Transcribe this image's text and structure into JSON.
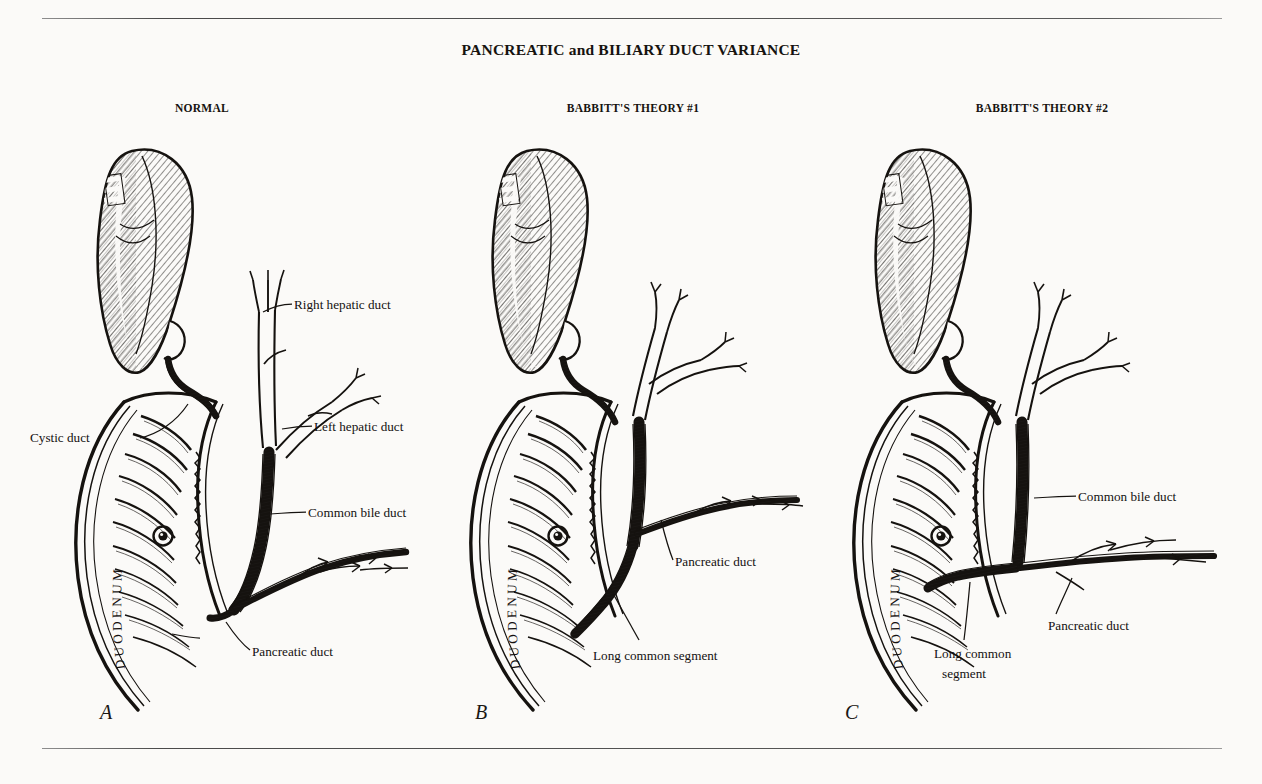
{
  "figure": {
    "title": "PANCREATIC and BILIARY DUCT VARIANCE",
    "background_color": "#fbfaf8",
    "ink_color": "#141110",
    "rule_color": "#4a4a4a"
  },
  "panels": [
    {
      "id": "A",
      "letter": "A",
      "title": "NORMAL",
      "labels": [
        {
          "name": "right-hepatic-duct",
          "text": "Right hepatic duct"
        },
        {
          "name": "left-hepatic-duct",
          "text": "Left hepatic duct"
        },
        {
          "name": "cystic-duct",
          "text": "Cystic duct"
        },
        {
          "name": "common-bile-duct",
          "text": "Common bile duct"
        },
        {
          "name": "pancreatic-duct",
          "text": "Pancreatic duct"
        }
      ],
      "organ_label": "DUODENUM",
      "structures": [
        "gallbladder",
        "cystic duct",
        "right hepatic duct",
        "left hepatic duct",
        "common bile duct",
        "pancreatic duct",
        "duodenum",
        "duodenal papilla"
      ]
    },
    {
      "id": "B",
      "letter": "B",
      "title": "BABBITT'S THEORY #1",
      "labels": [
        {
          "name": "pancreatic-duct",
          "text": "Pancreatic duct"
        },
        {
          "name": "long-common-segment",
          "text": "Long common segment"
        }
      ],
      "organ_label": "DUODENUM",
      "structures": [
        "gallbladder",
        "cystic duct",
        "hepatic ducts",
        "common bile duct",
        "pancreatic duct",
        "long common segment",
        "duodenum",
        "duodenal papilla"
      ]
    },
    {
      "id": "C",
      "letter": "C",
      "title": "BABBITT'S THEORY #2",
      "labels": [
        {
          "name": "common-bile-duct",
          "text": "Common bile duct"
        },
        {
          "name": "pancreatic-duct",
          "text": "Pancreatic duct"
        },
        {
          "name": "long-common-segment-line1",
          "text": "Long common"
        },
        {
          "name": "long-common-segment-line2",
          "text": "segment"
        }
      ],
      "organ_label": "DUODENUM",
      "structures": [
        "gallbladder",
        "cystic duct",
        "hepatic ducts",
        "common bile duct",
        "pancreatic duct",
        "long common segment",
        "duodenum",
        "duodenal papilla"
      ]
    }
  ]
}
